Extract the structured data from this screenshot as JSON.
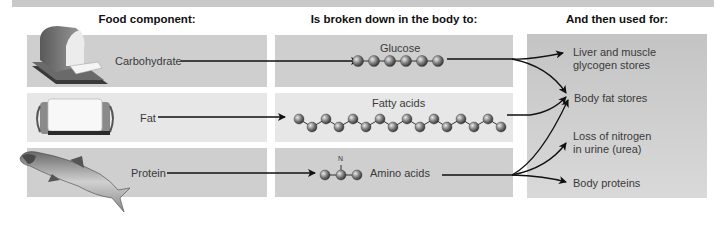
{
  "headers": {
    "food_component": "Food component:",
    "broken_down": "Is broken down in the body to:",
    "used_for": "And then used for:"
  },
  "rows": [
    {
      "food": "Carbohydrate",
      "food_icon": "bread-icon",
      "product": "Glucose",
      "carbon_chain_length": 6
    },
    {
      "food": "Fat",
      "food_icon": "butter-icon",
      "product": "Fatty acids",
      "carbon_chain_length": 16
    },
    {
      "food": "Protein",
      "food_icon": "fish-icon",
      "product": "Amino acids",
      "carbon_chain_length": 3,
      "extra_atom": "N"
    }
  ],
  "uses": [
    {
      "line1": "Liver and muscle",
      "line2": "glycogen stores"
    },
    {
      "line1": "Body fat stores",
      "line2": ""
    },
    {
      "line1": "Loss of nitrogen",
      "line2": "in urine (urea)"
    },
    {
      "line1": "Body proteins",
      "line2": ""
    }
  ],
  "atom_label": "C",
  "colors": {
    "box_dark": "#cfcfcf",
    "box_light": "#e7e7e7",
    "arrow": "#111111",
    "atom": "#6a6a6a"
  }
}
